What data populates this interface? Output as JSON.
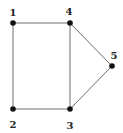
{
  "diagram": {
    "type": "undirected-graph",
    "nodes": [
      {
        "id": "1",
        "label": "1",
        "x": 13,
        "y": 23,
        "lx": 13,
        "ly": 16
      },
      {
        "id": "2",
        "label": "2",
        "x": 13,
        "y": 109,
        "lx": 13,
        "ly": 128
      },
      {
        "id": "3",
        "label": "3",
        "x": 70,
        "y": 109,
        "lx": 70,
        "ly": 129
      },
      {
        "id": "4",
        "label": "4",
        "x": 70,
        "y": 23,
        "lx": 69,
        "ly": 15
      },
      {
        "id": "5",
        "label": "5",
        "x": 112,
        "y": 66,
        "lx": 114,
        "ly": 59
      }
    ],
    "edges": [
      {
        "from": "1",
        "to": "4"
      },
      {
        "from": "1",
        "to": "2"
      },
      {
        "from": "2",
        "to": "3"
      },
      {
        "from": "3",
        "to": "4"
      },
      {
        "from": "4",
        "to": "5"
      },
      {
        "from": "3",
        "to": "5"
      }
    ]
  }
}
